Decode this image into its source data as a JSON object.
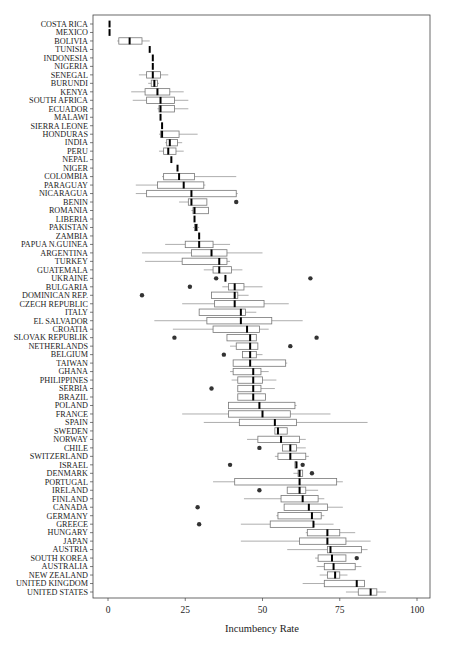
{
  "chart_data": {
    "type": "boxplot",
    "title": "",
    "xlabel": "Incumbency Rate",
    "ylabel": "",
    "xlim": [
      -6,
      104
    ],
    "xticks": [
      0,
      25,
      50,
      75,
      100
    ],
    "grid": false,
    "legend": null,
    "series": [
      {
        "country": "COSTA RICA",
        "min": 0.5,
        "q1": 0.5,
        "median": 0.5,
        "q3": 0.5,
        "max": 0.5,
        "outliers": []
      },
      {
        "country": "MEXICO",
        "min": 0.5,
        "q1": 0.5,
        "median": 0.5,
        "q3": 0.5,
        "max": 0.5,
        "outliers": []
      },
      {
        "country": "BOLIVIA",
        "min": 3,
        "q1": 3.5,
        "median": 7,
        "q3": 11,
        "max": 13.5,
        "outliers": []
      },
      {
        "country": "TUNISIA",
        "min": 13.5,
        "q1": 13.5,
        "median": 13.5,
        "q3": 13.5,
        "max": 13.5,
        "outliers": []
      },
      {
        "country": "INDONESIA",
        "min": 14.5,
        "q1": 14.5,
        "median": 14.5,
        "q3": 14.5,
        "max": 14.5,
        "outliers": []
      },
      {
        "country": "NIGERIA",
        "min": 14.5,
        "q1": 14.5,
        "median": 14.5,
        "q3": 14.5,
        "max": 14.5,
        "outliers": []
      },
      {
        "country": "SENEGAL",
        "min": 10,
        "q1": 12.5,
        "median": 14.5,
        "q3": 17,
        "max": 19.5,
        "outliers": []
      },
      {
        "country": "BURUNDI",
        "min": 13,
        "q1": 14,
        "median": 15,
        "q3": 16,
        "max": 16.5,
        "outliers": []
      },
      {
        "country": "KENYA",
        "min": 7.5,
        "q1": 12,
        "median": 16,
        "q3": 20,
        "max": 24.5,
        "outliers": []
      },
      {
        "country": "SOUTH AFRICA",
        "min": 8,
        "q1": 12.5,
        "median": 17,
        "q3": 21.5,
        "max": 26,
        "outliers": []
      },
      {
        "country": "ECUADOR",
        "min": 16,
        "q1": 16.5,
        "median": 17,
        "q3": 21.5,
        "max": 26,
        "outliers": []
      },
      {
        "country": "MALAWI",
        "min": 17,
        "q1": 17,
        "median": 17,
        "q3": 17,
        "max": 17,
        "outliers": []
      },
      {
        "country": "SIERRA LEONE",
        "min": 17.5,
        "q1": 17.5,
        "median": 17.5,
        "q3": 17.5,
        "max": 17.5,
        "outliers": []
      },
      {
        "country": "HONDURAS",
        "min": 16.5,
        "q1": 17,
        "median": 17.5,
        "q3": 23,
        "max": 29,
        "outliers": []
      },
      {
        "country": "INDIA",
        "min": 18.5,
        "q1": 19,
        "median": 20,
        "q3": 22.5,
        "max": 24,
        "outliers": []
      },
      {
        "country": "PERU",
        "min": 16.5,
        "q1": 18,
        "median": 19.5,
        "q3": 22,
        "max": 24.5,
        "outliers": []
      },
      {
        "country": "NEPAL",
        "min": 20.5,
        "q1": 20.5,
        "median": 20.5,
        "q3": 20.5,
        "max": 20.5,
        "outliers": []
      },
      {
        "country": "NIGER",
        "min": 22.5,
        "q1": 22.5,
        "median": 22.5,
        "q3": 22.5,
        "max": 22.5,
        "outliers": []
      },
      {
        "country": "COLOMBIA",
        "min": 17.5,
        "q1": 18,
        "median": 23,
        "q3": 28,
        "max": 41.5,
        "outliers": []
      },
      {
        "country": "PARAGUAY",
        "min": 9,
        "q1": 16,
        "median": 24.5,
        "q3": 31,
        "max": 31.5,
        "outliers": []
      },
      {
        "country": "NICARAGUA",
        "min": 9,
        "q1": 12.5,
        "median": 27,
        "q3": 41.5,
        "max": 42,
        "outliers": []
      },
      {
        "country": "BENIN",
        "min": 23,
        "q1": 26,
        "median": 27,
        "q3": 32,
        "max": 32,
        "outliers": [
          41.5
        ]
      },
      {
        "country": "ROMANIA",
        "min": 27,
        "q1": 27.5,
        "median": 28,
        "q3": 32.5,
        "max": 32.5,
        "outliers": []
      },
      {
        "country": "LIBERIA",
        "min": 28,
        "q1": 28,
        "median": 28,
        "q3": 28,
        "max": 28,
        "outliers": []
      },
      {
        "country": "PAKISTAN",
        "min": 27.5,
        "q1": 28,
        "median": 28.5,
        "q3": 29,
        "max": 29.5,
        "outliers": []
      },
      {
        "country": "ZAMBIA",
        "min": 29.5,
        "q1": 29.5,
        "median": 29.5,
        "q3": 29.5,
        "max": 29.5,
        "outliers": []
      },
      {
        "country": "PAPUA N.GUINEA",
        "min": 18.5,
        "q1": 25,
        "median": 29.5,
        "q3": 34,
        "max": 39.5,
        "outliers": []
      },
      {
        "country": "ARGENTINA",
        "min": 11,
        "q1": 27,
        "median": 33.5,
        "q3": 38.5,
        "max": 50,
        "outliers": []
      },
      {
        "country": "TURKEY",
        "min": 12,
        "q1": 24,
        "median": 36,
        "q3": 38.5,
        "max": 39.5,
        "outliers": []
      },
      {
        "country": "GUATEMALA",
        "min": 31,
        "q1": 34,
        "median": 36,
        "q3": 40,
        "max": 43.5,
        "outliers": []
      },
      {
        "country": "UKRAINE",
        "min": 38,
        "q1": 38,
        "median": 38,
        "q3": 38,
        "max": 38,
        "outliers": [
          35,
          65.5
        ]
      },
      {
        "country": "BULGARIA",
        "min": 37,
        "q1": 39,
        "median": 41,
        "q3": 44,
        "max": 50,
        "outliers": [
          26.5
        ]
      },
      {
        "country": "DOMINICAN REP.",
        "min": 33.5,
        "q1": 33.5,
        "median": 41,
        "q3": 42,
        "max": 45.5,
        "outliers": [
          11
        ]
      },
      {
        "country": "CZECH REPUBLIC",
        "min": 24,
        "q1": 34.5,
        "median": 41,
        "q3": 50.5,
        "max": 58.5,
        "outliers": []
      },
      {
        "country": "ITALY",
        "min": 29.5,
        "q1": 29.5,
        "median": 43,
        "q3": 44.5,
        "max": 48,
        "outliers": []
      },
      {
        "country": "EL SALVADOR",
        "min": 15,
        "q1": 32,
        "median": 43,
        "q3": 53,
        "max": 63,
        "outliers": []
      },
      {
        "country": "CROATIA",
        "min": 21,
        "q1": 34,
        "median": 45,
        "q3": 49,
        "max": 52,
        "outliers": []
      },
      {
        "country": "SLOVAK REPUBLIK",
        "min": 38.5,
        "q1": 38.5,
        "median": 46,
        "q3": 48,
        "max": 48,
        "outliers": [
          21.5,
          67.5
        ]
      },
      {
        "country": "NETHERLANDS",
        "min": 39.5,
        "q1": 41.5,
        "median": 46,
        "q3": 48.5,
        "max": 48.5,
        "outliers": [
          59
        ]
      },
      {
        "country": "BELGIUM",
        "min": 43.5,
        "q1": 43.5,
        "median": 46,
        "q3": 48,
        "max": 50,
        "outliers": [
          37.5
        ]
      },
      {
        "country": "TAIWAN",
        "min": 40.5,
        "q1": 40.5,
        "median": 46,
        "q3": 57.5,
        "max": 58,
        "outliers": []
      },
      {
        "country": "GHANA",
        "min": 39.5,
        "q1": 40.5,
        "median": 47,
        "q3": 49.5,
        "max": 52,
        "outliers": []
      },
      {
        "country": "PHILIPPINES",
        "min": 40,
        "q1": 42,
        "median": 47,
        "q3": 50,
        "max": 54.5,
        "outliers": []
      },
      {
        "country": "SERBIA",
        "min": 42,
        "q1": 42,
        "median": 47,
        "q3": 49.5,
        "max": 54,
        "outliers": [
          33.5
        ]
      },
      {
        "country": "BRAZIL",
        "min": 42,
        "q1": 42,
        "median": 47,
        "q3": 51,
        "max": 51,
        "outliers": []
      },
      {
        "country": "POLAND",
        "min": 39,
        "q1": 39,
        "median": 49,
        "q3": 60.5,
        "max": 61,
        "outliers": []
      },
      {
        "country": "FRANCE",
        "min": 24,
        "q1": 39,
        "median": 50,
        "q3": 59,
        "max": 72,
        "outliers": []
      },
      {
        "country": "SPAIN",
        "min": 31,
        "q1": 42.5,
        "median": 54,
        "q3": 61,
        "max": 84,
        "outliers": []
      },
      {
        "country": "SWEDEN",
        "min": 54,
        "q1": 54,
        "median": 55,
        "q3": 58,
        "max": 58,
        "outliers": []
      },
      {
        "country": "NORWAY",
        "min": 45,
        "q1": 48.5,
        "median": 56,
        "q3": 62,
        "max": 64,
        "outliers": []
      },
      {
        "country": "CHILE",
        "min": 56.5,
        "q1": 56.5,
        "median": 59,
        "q3": 61,
        "max": 64,
        "outliers": [
          49
        ]
      },
      {
        "country": "SWITZERLAND",
        "min": 54,
        "q1": 55,
        "median": 59,
        "q3": 64,
        "max": 65,
        "outliers": []
      },
      {
        "country": "ISRAEL",
        "min": 60.5,
        "q1": 60.5,
        "median": 61,
        "q3": 61,
        "max": 61,
        "outliers": [
          39.5,
          63
        ]
      },
      {
        "country": "DENMARK",
        "min": 60,
        "q1": 61.5,
        "median": 62,
        "q3": 63,
        "max": 63,
        "outliers": [
          66
        ]
      },
      {
        "country": "PORTUGAL",
        "min": 34,
        "q1": 41,
        "median": 62,
        "q3": 74,
        "max": 76,
        "outliers": []
      },
      {
        "country": "IRELAND",
        "min": 58,
        "q1": 58,
        "median": 62,
        "q3": 64,
        "max": 68,
        "outliers": [
          49
        ]
      },
      {
        "country": "FINLAND",
        "min": 44,
        "q1": 56,
        "median": 63,
        "q3": 68,
        "max": 70,
        "outliers": []
      },
      {
        "country": "CANADA",
        "min": 57,
        "q1": 57,
        "median": 65,
        "q3": 71,
        "max": 76,
        "outliers": [
          29
        ]
      },
      {
        "country": "GERMANY",
        "min": 54.5,
        "q1": 55,
        "median": 66,
        "q3": 69,
        "max": 70,
        "outliers": []
      },
      {
        "country": "GREECE",
        "min": 43,
        "q1": 52.5,
        "median": 66.5,
        "q3": 66.5,
        "max": 73,
        "outliers": [
          29.5
        ]
      },
      {
        "country": "HUNGARY",
        "min": 64,
        "q1": 64.5,
        "median": 71,
        "q3": 75,
        "max": 80,
        "outliers": []
      },
      {
        "country": "JAPAN",
        "min": 43,
        "q1": 62,
        "median": 71,
        "q3": 77,
        "max": 85,
        "outliers": []
      },
      {
        "country": "AUSTRIA",
        "min": 58,
        "q1": 71,
        "median": 72,
        "q3": 82,
        "max": 84,
        "outliers": []
      },
      {
        "country": "SOUTH KOREA",
        "min": 67,
        "q1": 68,
        "median": 72.5,
        "q3": 77,
        "max": 77,
        "outliers": [
          80.5
        ]
      },
      {
        "country": "AUSTRALIA",
        "min": 67.5,
        "q1": 70,
        "median": 73,
        "q3": 80,
        "max": 82,
        "outliers": []
      },
      {
        "country": "NEW ZEALAND",
        "min": 68.5,
        "q1": 71,
        "median": 73.5,
        "q3": 75,
        "max": 77.5,
        "outliers": []
      },
      {
        "country": "UNITED KINGDOM",
        "min": 63,
        "q1": 70,
        "median": 80.5,
        "q3": 83,
        "max": 83,
        "outliers": []
      },
      {
        "country": "UNITED STATES",
        "min": 77,
        "q1": 81,
        "median": 85,
        "q3": 87,
        "max": 90,
        "outliers": []
      }
    ]
  },
  "axis": {
    "xlabel": "Incumbency Rate",
    "ticks": [
      "0",
      "25",
      "50",
      "75",
      "100"
    ]
  }
}
